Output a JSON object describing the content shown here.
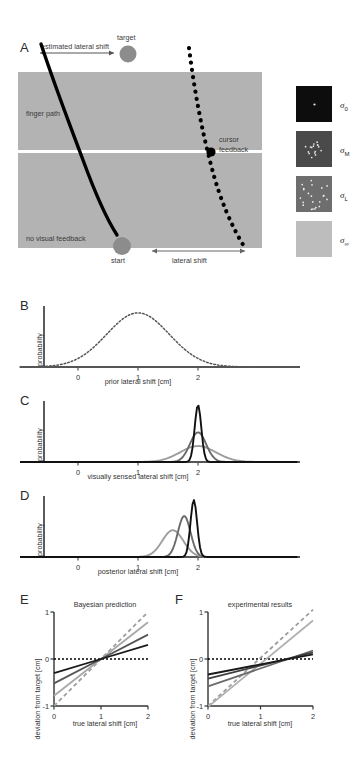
{
  "figure": {
    "background": "#ffffff",
    "panels": [
      "A",
      "B",
      "C",
      "D",
      "E",
      "F"
    ]
  },
  "panelA": {
    "letter": "A",
    "labels": {
      "estimated_lateral_shift": "estimated lateral shift",
      "target": "target",
      "finger_path": "finger path",
      "cursor_feedback_line1": "cursor",
      "cursor_feedback_line2": "feedback",
      "no_visual_feedback": "no visual feedback",
      "start": "start",
      "lateral_shift": "lateral shift"
    },
    "colors": {
      "workspace_gray": "#b3b3b3",
      "target_dot": "#8c8c8c",
      "start_dot": "#8c8c8c",
      "path_black": "#000000",
      "divider_white": "#ffffff"
    }
  },
  "legend": {
    "items": [
      {
        "name": "sigma-0",
        "sigma": "σ",
        "sub": "0",
        "swatch": "#0d0d0d",
        "dots": 1,
        "dot_spread": 1,
        "dot_color": "#e8e8e8"
      },
      {
        "name": "sigma-M",
        "sigma": "σ",
        "sub": "M",
        "swatch": "#4a4a4a",
        "dots": 16,
        "dot_spread": 9,
        "dot_color": "#e8e8e8"
      },
      {
        "name": "sigma-L",
        "sigma": "σ",
        "sub": "L",
        "swatch": "#6e6e6e",
        "dots": 22,
        "dot_spread": 16,
        "dot_color": "#f0f0f0"
      },
      {
        "name": "sigma-inf",
        "sigma": "σ",
        "sub": "∞",
        "swatch": "#bdbdbd",
        "dots": 0,
        "dot_spread": 0,
        "dot_color": "#ffffff"
      }
    ]
  },
  "panelB": {
    "letter": "B",
    "ylabel": "probability",
    "xlabel": "prior lateral shift [cm]",
    "ticks": [
      "0",
      "1",
      "2"
    ],
    "curve_style": "dotted",
    "curve_color": "#555555"
  },
  "panelC": {
    "letter": "C",
    "ylabel": "probability",
    "xlabel": "visually sensed lateral shift [cm]",
    "ticks": [
      "0",
      "1",
      "2"
    ],
    "curves": [
      {
        "name": "sigma-0-likelihood",
        "color": "#111111",
        "mean": 2.0,
        "sd": 0.055,
        "peak": 1.0
      },
      {
        "name": "sigma-M-likelihood",
        "color": "#6a6a6a",
        "mean": 2.0,
        "sd": 0.135,
        "peak": 0.52
      },
      {
        "name": "sigma-L-likelihood",
        "color": "#9d9d9d",
        "mean": 2.0,
        "sd": 0.3,
        "peak": 0.28
      }
    ]
  },
  "panelD": {
    "letter": "D",
    "ylabel": "probability",
    "xlabel": "posterior lateral shift [cm]",
    "ticks": [
      "0",
      "1",
      "2"
    ],
    "curves": [
      {
        "name": "sigma-0-posterior",
        "color": "#111111",
        "mean": 1.93,
        "sd": 0.055,
        "peak": 1.0
      },
      {
        "name": "sigma-M-posterior",
        "color": "#6a6a6a",
        "mean": 1.77,
        "sd": 0.105,
        "peak": 0.72
      },
      {
        "name": "sigma-L-posterior",
        "color": "#9d9d9d",
        "mean": 1.58,
        "sd": 0.175,
        "peak": 0.47
      }
    ]
  },
  "panelE": {
    "letter": "E",
    "title": "Bayesian prediction",
    "ylabel": "deviation from target [cm]",
    "xlabel": "true lateral shift [cm]",
    "yticks": [
      "1",
      "0",
      "-1"
    ],
    "xticks": [
      "0",
      "1",
      "2"
    ],
    "chart_data": {
      "type": "line",
      "xlim": [
        0,
        2
      ],
      "ylim": [
        -1,
        1
      ],
      "x": [
        0,
        1,
        2
      ],
      "series": [
        {
          "name": "sigma-0",
          "color": "#9e9e9e",
          "dash": "4,3",
          "values": [
            -1.0,
            0.0,
            1.0
          ]
        },
        {
          "name": "sigma-inf",
          "color": "#a8a8a8",
          "dash": "",
          "values": [
            -0.78,
            0.0,
            0.78
          ]
        },
        {
          "name": "sigma-L",
          "color": "#555555",
          "dash": "",
          "values": [
            -0.52,
            0.0,
            0.52
          ]
        },
        {
          "name": "sigma-M",
          "color": "#1a1a1a",
          "dash": "",
          "values": [
            -0.3,
            0.0,
            0.3
          ]
        }
      ],
      "zero_line": {
        "name": "zero-reference",
        "color": "#000000",
        "dash": "2,2",
        "y": 0
      }
    }
  },
  "panelF": {
    "letter": "F",
    "title": "experimental results",
    "ylabel": "deviation from target [cm]",
    "xlabel": "true lateral shift [cm]",
    "yticks": [
      "1",
      "0",
      "-1"
    ],
    "xticks": [
      "0",
      "1",
      "2"
    ],
    "chart_data": {
      "type": "line",
      "xlim": [
        0,
        2
      ],
      "ylim": [
        -1,
        1
      ],
      "x": [
        0,
        2
      ],
      "series": [
        {
          "name": "sigma-0",
          "color": "#9e9e9e",
          "dash": "4,3",
          "values": [
            -1.0,
            1.05
          ]
        },
        {
          "name": "sigma-inf",
          "color": "#b0b0b0",
          "dash": "",
          "values": [
            -1.02,
            0.82
          ]
        },
        {
          "name": "sigma-L",
          "color": "#6a6a6a",
          "dash": "",
          "values": [
            -0.58,
            0.18
          ]
        },
        {
          "name": "sigma-M",
          "color": "#3d3d3d",
          "dash": "",
          "values": [
            -0.42,
            0.14
          ]
        },
        {
          "name": "sigma-M2",
          "color": "#1a1a1a",
          "dash": "",
          "values": [
            -0.33,
            0.1
          ]
        }
      ],
      "zero_line": {
        "name": "zero-reference",
        "color": "#000000",
        "dash": "2,2",
        "y": 0
      }
    }
  }
}
